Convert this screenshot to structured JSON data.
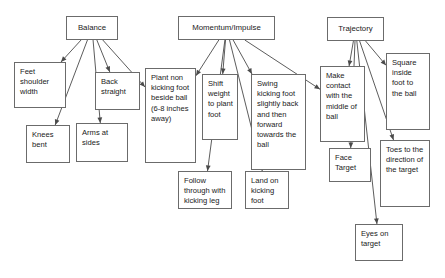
{
  "diagram": {
    "type": "flowchart",
    "background_color": "#ffffff",
    "box_border_color": "#6b6b6b",
    "arrow_color": "#4a4a4a",
    "text_color": "#1a1a1a",
    "roots": [
      {
        "id": "balance",
        "label": "Balance"
      },
      {
        "id": "momentum",
        "label": "Momentum/Impulse"
      },
      {
        "id": "trajectory",
        "label": "Trajectory"
      }
    ],
    "nodes": [
      {
        "id": "balance",
        "label": "Balance",
        "x": 66,
        "y": 16,
        "w": 52,
        "h": 24,
        "align": "center"
      },
      {
        "id": "momentum",
        "label": "Momentum/Impulse",
        "x": 178,
        "y": 16,
        "w": 97,
        "h": 24,
        "align": "center"
      },
      {
        "id": "trajectory",
        "label": "Trajectory",
        "x": 327,
        "y": 17,
        "w": 57,
        "h": 24,
        "align": "center"
      },
      {
        "id": "feet-shoulder-width",
        "label": "Feet shoulder width",
        "x": 14,
        "y": 62,
        "w": 52,
        "h": 46,
        "align": "left"
      },
      {
        "id": "back-straight",
        "label": "Back straight",
        "x": 95,
        "y": 72,
        "w": 45,
        "h": 38,
        "align": "left"
      },
      {
        "id": "knees-bent",
        "label": "Knees bent",
        "x": 26,
        "y": 125,
        "w": 44,
        "h": 38,
        "align": "left"
      },
      {
        "id": "arms-at-sides",
        "label": "Arms at sides",
        "x": 76,
        "y": 123,
        "w": 52,
        "h": 39,
        "align": "left"
      },
      {
        "id": "plant-non-kicking-foot",
        "label": "Plant non kicking foot beside ball (6-8 inches away)",
        "x": 145,
        "y": 68,
        "w": 51,
        "h": 95,
        "align": "left"
      },
      {
        "id": "shift-weight",
        "label": "Shift weight to plant foot",
        "x": 202,
        "y": 74,
        "w": 36,
        "h": 66,
        "align": "left"
      },
      {
        "id": "swing-kicking-foot",
        "label": "Swing kicking foot slightly back and then forward towards the ball",
        "x": 251,
        "y": 74,
        "w": 55,
        "h": 96,
        "align": "left"
      },
      {
        "id": "follow-through",
        "label": "Follow through with kicking leg",
        "x": 178,
        "y": 171,
        "w": 54,
        "h": 38,
        "align": "left"
      },
      {
        "id": "land-on-kicking-foot",
        "label": "Land on kicking foot",
        "x": 245,
        "y": 171,
        "w": 44,
        "h": 38,
        "align": "left"
      },
      {
        "id": "make-contact-middle",
        "label": "Make contact with the middle of ball",
        "x": 320,
        "y": 66,
        "w": 45,
        "h": 76,
        "align": "left"
      },
      {
        "id": "square-inside-foot",
        "label": "Square inside foot to the ball",
        "x": 386,
        "y": 53,
        "w": 44,
        "h": 77,
        "align": "left"
      },
      {
        "id": "face-target",
        "label": "Face Target",
        "x": 329,
        "y": 148,
        "w": 42,
        "h": 34,
        "align": "left"
      },
      {
        "id": "toes-to-direction",
        "label": "Toes to the direction of the target",
        "x": 380,
        "y": 140,
        "w": 50,
        "h": 67,
        "align": "left"
      },
      {
        "id": "eyes-on-target",
        "label": "Eyes on target",
        "x": 355,
        "y": 224,
        "w": 48,
        "h": 37,
        "align": "left"
      }
    ],
    "edges": [
      {
        "from": "balance",
        "to": "feet-shoulder-width"
      },
      {
        "from": "balance",
        "to": "back-straight"
      },
      {
        "from": "balance",
        "to": "knees-bent"
      },
      {
        "from": "balance",
        "to": "arms-at-sides"
      },
      {
        "from": "balance",
        "to": "plant-non-kicking-foot"
      },
      {
        "from": "momentum",
        "to": "plant-non-kicking-foot"
      },
      {
        "from": "momentum",
        "to": "shift-weight"
      },
      {
        "from": "momentum",
        "to": "swing-kicking-foot"
      },
      {
        "from": "momentum",
        "to": "follow-through"
      },
      {
        "from": "momentum",
        "to": "land-on-kicking-foot"
      },
      {
        "from": "momentum",
        "to": "make-contact-middle"
      },
      {
        "from": "trajectory",
        "to": "make-contact-middle"
      },
      {
        "from": "trajectory",
        "to": "square-inside-foot"
      },
      {
        "from": "trajectory",
        "to": "face-target"
      },
      {
        "from": "trajectory",
        "to": "toes-to-direction"
      },
      {
        "from": "trajectory",
        "to": "eyes-on-target"
      }
    ]
  }
}
